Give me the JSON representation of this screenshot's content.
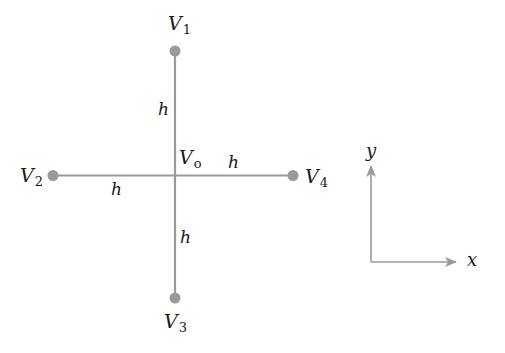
{
  "diagram": {
    "type": "five-point finite-difference stencil",
    "colors": {
      "line": "#9a9a9a",
      "node": "#9a9a9a",
      "text": "#1a1a1a",
      "axis": "#9a9a9a"
    },
    "center": {
      "label": "V",
      "subscript": "o"
    },
    "nodes": [
      {
        "id": "V1",
        "label": "V",
        "subscript": "1",
        "position": "top"
      },
      {
        "id": "V2",
        "label": "V",
        "subscript": "2",
        "position": "left"
      },
      {
        "id": "V3",
        "label": "V",
        "subscript": "3",
        "position": "bottom"
      },
      {
        "id": "V4",
        "label": "V",
        "subscript": "4",
        "position": "right"
      }
    ],
    "spacing_labels": [
      {
        "text": "h",
        "segment": "center-V1"
      },
      {
        "text": "h",
        "segment": "center-V2"
      },
      {
        "text": "h",
        "segment": "center-V3"
      },
      {
        "text": "h",
        "segment": "center-V4"
      }
    ],
    "axes": {
      "x_label": "x",
      "y_label": "y"
    }
  }
}
